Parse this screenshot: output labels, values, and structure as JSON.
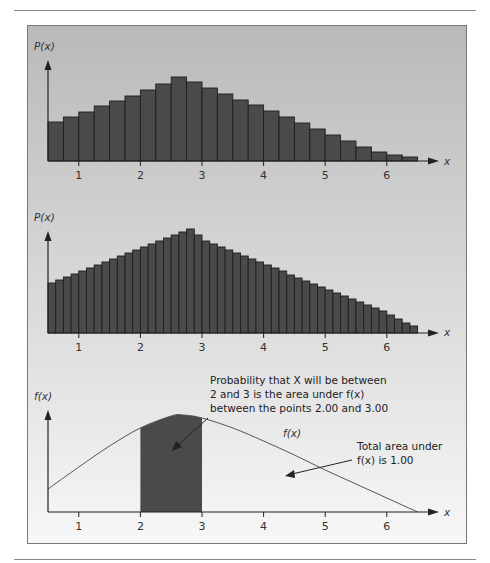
{
  "chart_data": [
    {
      "type": "bar",
      "title": "",
      "ylabel": "P(x)",
      "xlabel": "x",
      "bin_width": 0.25,
      "x_start": 0.5,
      "xticks": [
        1,
        2,
        3,
        4,
        5,
        6
      ],
      "values": [
        39,
        44,
        49,
        55,
        60,
        65,
        71,
        77,
        84,
        79,
        73,
        67,
        61,
        56,
        50,
        44,
        38,
        32,
        26,
        20,
        14,
        9,
        6,
        4
      ],
      "value_units": "relative height (px)",
      "grid": false
    },
    {
      "type": "bar",
      "title": "",
      "ylabel": "P(x)",
      "xlabel": "x",
      "bin_width": 0.125,
      "x_start": 0.5,
      "xticks": [
        1,
        2,
        3,
        4,
        5,
        6
      ],
      "values": [
        50,
        53,
        56,
        59,
        62,
        65,
        68,
        71,
        74,
        77,
        80,
        83,
        86,
        89,
        92,
        95,
        98,
        101,
        104,
        98,
        92,
        89,
        86,
        83,
        80,
        77,
        74,
        71,
        68,
        65,
        62,
        58,
        55,
        52,
        49,
        46,
        43,
        40,
        37,
        34,
        31,
        28,
        25,
        22,
        18,
        14,
        10,
        7
      ],
      "value_units": "relative height (px)",
      "grid": false
    },
    {
      "type": "area",
      "title": "",
      "ylabel": "f(x)",
      "xlabel": "x",
      "xticks": [
        1,
        2,
        3,
        4,
        5,
        6
      ],
      "curve_label": "f(x)",
      "curve_points": [
        [
          0.5,
          23
        ],
        [
          1.0,
          45
        ],
        [
          1.5,
          66
        ],
        [
          2.0,
          84
        ],
        [
          2.5,
          96
        ],
        [
          2.7,
          97
        ],
        [
          3.0,
          94
        ],
        [
          3.5,
          84
        ],
        [
          4.0,
          71
        ],
        [
          4.5,
          57
        ],
        [
          5.0,
          42
        ],
        [
          5.5,
          28
        ],
        [
          6.0,
          14
        ],
        [
          6.5,
          0
        ]
      ],
      "shaded_interval": [
        2.0,
        3.0
      ],
      "annotations": [
        {
          "lines": [
            "Probability that X will be between",
            "2 and 3 is the area under f(x)",
            "between the points 2.00 and 3.00"
          ]
        },
        {
          "lines": [
            "Total area under",
            "f(x) is 1.00"
          ]
        }
      ]
    }
  ],
  "panels": {
    "hist1": {
      "ylabel": "P(x)",
      "xlabel": "x"
    },
    "hist2": {
      "ylabel": "P(x)",
      "xlabel": "x"
    },
    "density": {
      "ylabel": "f(x)",
      "xlabel": "x",
      "curve_label": "f(x)",
      "ann1": [
        "Probability that X will be between",
        "2 and 3 is the area under f(x)",
        "between the points 2.00 and 3.00"
      ],
      "ann2": [
        "Total area under",
        "f(x) is 1.00"
      ]
    }
  },
  "colors": {
    "bar_fill": "#4a4a4a",
    "bar_stroke": "#1e1e1e",
    "panel_top": "#b9b9b9",
    "panel_bottom": "#f7f7f7",
    "shade": "#4a4a4a",
    "axis": "#222222"
  }
}
